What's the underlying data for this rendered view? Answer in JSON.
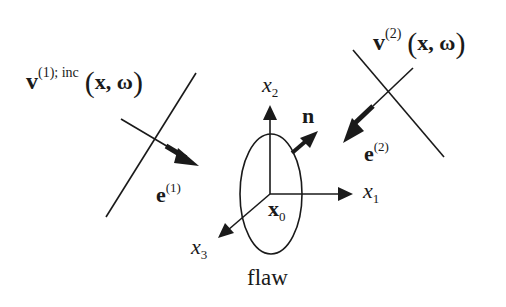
{
  "diagram": {
    "labels": {
      "incident_field": {
        "symbol": "v",
        "superscript": "(1); inc",
        "args_open": "(",
        "args": "x, ω",
        "args_close": ")"
      },
      "scattered_field": {
        "symbol": "v",
        "superscript": "(2)",
        "args_open": "(",
        "args": "x, ω",
        "args_close": ")"
      },
      "e1": {
        "symbol": "e",
        "superscript": "(1)"
      },
      "e2": {
        "symbol": "e",
        "superscript": "(2)"
      },
      "normal": "n",
      "x1": {
        "symbol": "x",
        "subscript": "1"
      },
      "x2": {
        "symbol": "x",
        "subscript": "2"
      },
      "x3": {
        "symbol": "x",
        "subscript": "3"
      },
      "origin": {
        "symbol": "x",
        "subscript": "0"
      },
      "flaw": "flaw"
    },
    "colors": {
      "stroke": "#1a1a1a",
      "background": "#ffffff"
    }
  }
}
